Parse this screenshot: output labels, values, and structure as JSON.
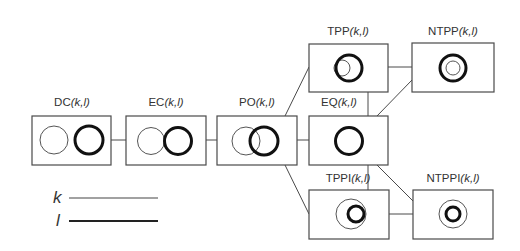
{
  "diagram": {
    "type": "RCC-8 relation graph",
    "args": "(k,l)",
    "nodes": [
      {
        "id": "DC",
        "name": "DC",
        "label_suffix": "(k,l)",
        "x": 32,
        "y": 116,
        "w": 79,
        "h": 49
      },
      {
        "id": "EC",
        "name": "EC",
        "label_suffix": "(k,l)",
        "x": 126,
        "y": 116,
        "w": 80,
        "h": 49
      },
      {
        "id": "PO",
        "name": "PO",
        "label_suffix": "(k,l)",
        "x": 217,
        "y": 116,
        "w": 80,
        "h": 49
      },
      {
        "id": "TPP",
        "name": "TPP",
        "label_suffix": "(k,l)",
        "x": 309,
        "y": 44,
        "w": 79,
        "h": 48
      },
      {
        "id": "EQ",
        "name": "EQ",
        "label_suffix": "(k,l)",
        "x": 309,
        "y": 116,
        "w": 79,
        "h": 49
      },
      {
        "id": "NTPP",
        "name": "NTPP",
        "label_suffix": "(k,l)",
        "x": 412,
        "y": 43,
        "w": 82,
        "h": 49
      },
      {
        "id": "TPPI",
        "name": "TPPI",
        "label_suffix": "(k,l)",
        "x": 309,
        "y": 190,
        "w": 80,
        "h": 49
      },
      {
        "id": "NTPPI",
        "name": "NTPPI",
        "label_suffix": "(k,l)",
        "x": 413,
        "y": 190,
        "w": 80,
        "h": 49
      }
    ],
    "edges": [
      [
        "DC",
        "EC"
      ],
      [
        "EC",
        "PO"
      ],
      [
        "PO",
        "EQ"
      ],
      [
        "PO",
        "TPP"
      ],
      [
        "PO",
        "TPPI"
      ],
      [
        "TPP",
        "EQ"
      ],
      [
        "EQ",
        "TPPI"
      ],
      [
        "TPP",
        "NTPP"
      ],
      [
        "EQ",
        "NTPP"
      ],
      [
        "EQ",
        "NTPPI"
      ],
      [
        "TPPI",
        "NTPPI"
      ]
    ],
    "labels": {
      "DC": {
        "name": "DC",
        "args": "(k,l)"
      },
      "EC": {
        "name": "EC",
        "args": "(k,l)"
      },
      "PO": {
        "name": "PO",
        "args": "(k,l)"
      },
      "TPP": {
        "name": "TPP",
        "args": "(k,l)"
      },
      "EQ": {
        "name": "EQ",
        "args": "(k,l)"
      },
      "NTPP": {
        "name": "NTPP",
        "args": "(k,l)"
      },
      "TPPI": {
        "name": "TPPI",
        "args": "(k,l)"
      },
      "NTPPI": {
        "name": "NTPPI",
        "args": "(k,l)"
      }
    }
  },
  "legend": {
    "k": {
      "symbol": "k",
      "style": "thin line"
    },
    "l": {
      "symbol": "l",
      "style": "thick line"
    }
  },
  "colors": {
    "box_stroke": "#4a4a4a",
    "k_stroke": "#555555",
    "l_stroke": "#111111",
    "text": "#333333"
  }
}
